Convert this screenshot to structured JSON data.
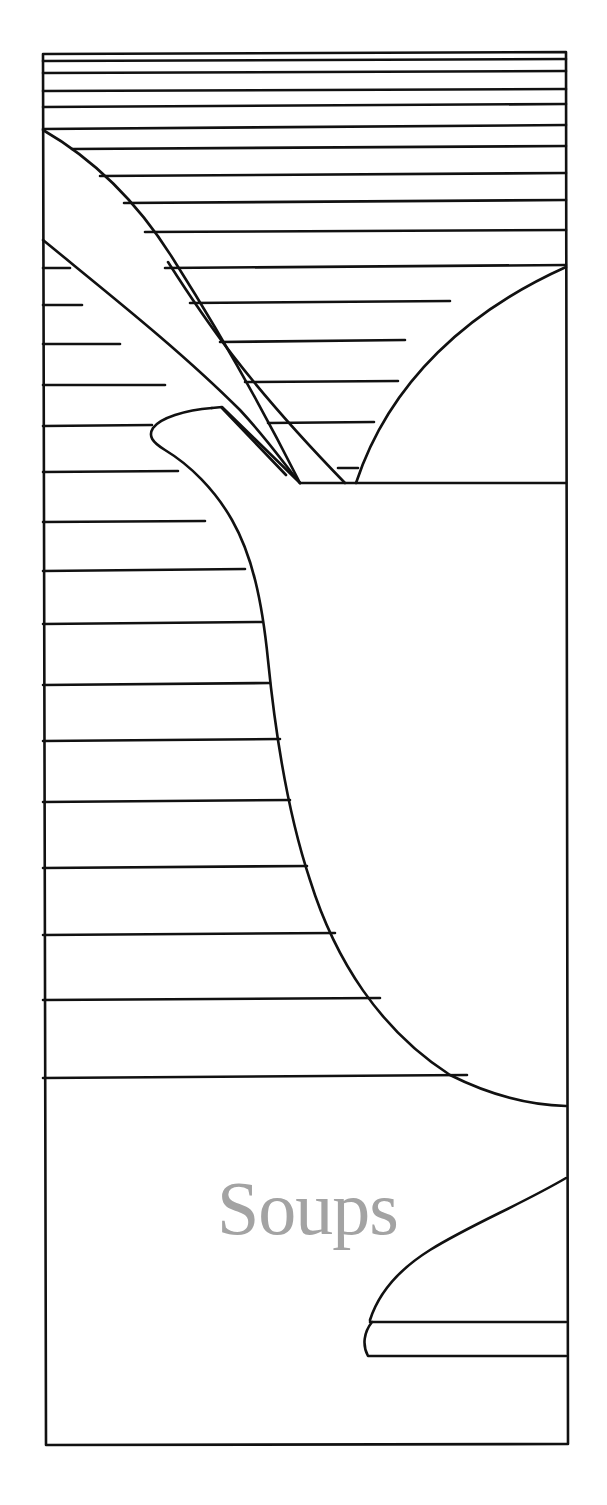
{
  "page": {
    "title": "Soups",
    "colors": {
      "ink": "#111111",
      "paper": "#ffffff",
      "title_gray": "#a3a3a3"
    }
  },
  "illustration": {
    "subject": "tureen-with-ladle",
    "frame": {
      "left": 43,
      "top": 53,
      "right": 567,
      "bottom": 1443
    },
    "stripes_full_width_y": [
      53,
      60,
      72,
      90,
      105,
      123,
      146,
      173,
      200,
      231,
      266
    ],
    "stripes_left_y": [
      304,
      344,
      384,
      425,
      471,
      522,
      570,
      624,
      685,
      740,
      802,
      867,
      934,
      1000,
      1077
    ]
  }
}
